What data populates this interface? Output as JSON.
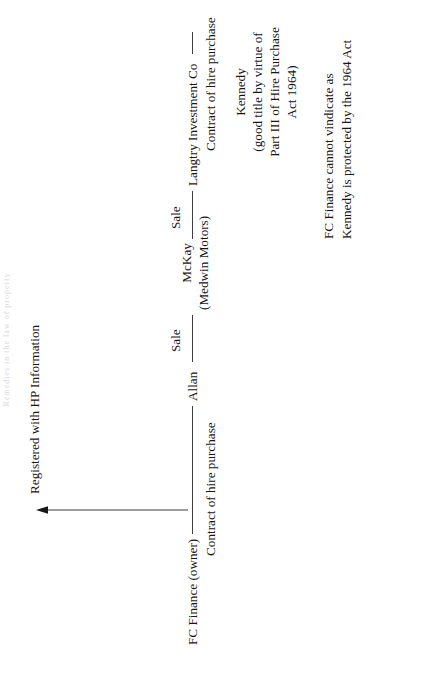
{
  "page": {
    "faint_header": "Remedies in the law of property",
    "background_color": "#ffffff",
    "ink_color": "#15151a",
    "line_color": "#3d3d42",
    "rotation_degrees": -90
  },
  "diagram": {
    "type": "chain-of-title-flow",
    "nodes": {
      "fc_finance": "FC Finance (owner)",
      "registered": "Registered with HP Information",
      "allan": "Allan",
      "mckay_line1": "McKay",
      "mckay_line2": "(Medwin Motors)",
      "langtry": "Langtry Investment Co",
      "kennedy_line1": "Kennedy",
      "kennedy_line2": "(good title by virtue of",
      "kennedy_line3": "Part III of Hire Purchase",
      "kennedy_line4": "Act 1964)"
    },
    "edges": [
      {
        "id": "fc-to-registered",
        "from": "FC Finance (owner)",
        "to": "Registered with HP Information",
        "label": "",
        "arrow": true,
        "orientation": "vertical"
      },
      {
        "id": "fc-to-allan",
        "from": "FC Finance (owner)",
        "to": "Allan",
        "label": "Contract of hire purchase",
        "arrow": false,
        "orientation": "horizontal"
      },
      {
        "id": "allan-to-mckay",
        "from": "Allan",
        "to": "McKay (Medwin Motors)",
        "label": "Sale",
        "arrow": false,
        "orientation": "horizontal"
      },
      {
        "id": "mckay-to-langtry",
        "from": "McKay (Medwin Motors)",
        "to": "Langtry Investment Co",
        "label": "Sale",
        "arrow": false,
        "orientation": "horizontal"
      },
      {
        "id": "langtry-to-kennedy",
        "from": "Langtry Investment Co",
        "to": "Kennedy",
        "label": "Contract of hire purchase",
        "arrow": false,
        "orientation": "horizontal"
      }
    ],
    "edge_labels": {
      "contract_hp_1": "Contract of hire purchase",
      "sale_1": "Sale",
      "sale_2": "Sale",
      "contract_hp_2": "Contract of hire purchase"
    },
    "note": {
      "line1": "FC Finance cannot vindicate as",
      "line2": "Kennedy is protected by the 1964 Act"
    }
  }
}
